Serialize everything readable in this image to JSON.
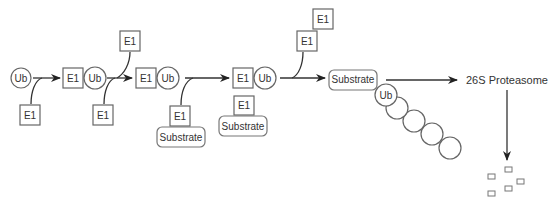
{
  "diagram": {
    "labels": {
      "ub": "Ub",
      "e1": "E1",
      "substrate": "Substrate",
      "proteasome": "26S Proteasome"
    },
    "steps": [
      {
        "id": "step1",
        "nodes": [
          "Ub"
        ],
        "input": "E1"
      },
      {
        "id": "step2",
        "nodes": [
          "E1",
          "Ub"
        ],
        "input": "E1",
        "output": "E1"
      },
      {
        "id": "step3",
        "nodes": [
          "E1",
          "Ub"
        ],
        "input": "E1 + Substrate"
      },
      {
        "id": "step4",
        "nodes": [
          "E1",
          "Ub"
        ],
        "below": [
          "E1",
          "Substrate"
        ],
        "output": "E1"
      },
      {
        "id": "step5",
        "nodes": [
          "Substrate",
          "Ub chain"
        ],
        "extra": "E1"
      },
      {
        "id": "step6",
        "nodes": [
          "26S Proteasome"
        ]
      },
      {
        "id": "step7",
        "nodes": [
          "peptide fragments"
        ]
      }
    ],
    "ub_chain_length": 5,
    "fragment_count": 5
  }
}
